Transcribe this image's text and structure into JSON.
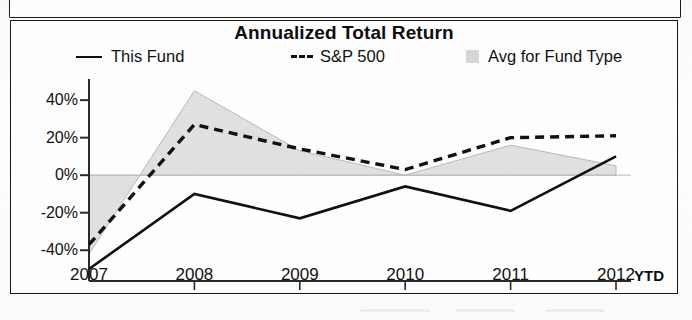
{
  "document": {
    "partial_box_above": true
  },
  "chart_panel": {
    "title": "Annualized Total Return",
    "legend": [
      {
        "key": "this_fund",
        "label": "This Fund",
        "marker": "solid-line-swatch",
        "color": "#111111"
      },
      {
        "key": "sp500",
        "label": "S&P 500",
        "marker": "dashed-line-swatch",
        "color": "#111111"
      },
      {
        "key": "avg_fund_type",
        "label": "Avg for Fund Type",
        "marker": "gray-area-swatch",
        "color": "#cfcfcf"
      }
    ],
    "x_axis_suffix": "YTD"
  },
  "chart_data": {
    "type": "line",
    "title": "Annualized Total Return",
    "xlabel": "",
    "ylabel": "",
    "categories": [
      "2007",
      "2008",
      "2009",
      "2010",
      "2011",
      "2012"
    ],
    "x_tick_labels": [
      "2007",
      "2008",
      "2009",
      "2010",
      "2011",
      "2012"
    ],
    "x_axis_note": "YTD",
    "y_tick_labels": [
      "40%",
      "20%",
      "0%",
      "-20%",
      "-40%"
    ],
    "y_ticks": [
      40,
      20,
      0,
      -20,
      -40
    ],
    "ylim": [
      -50,
      47
    ],
    "grid": false,
    "legend_position": "top",
    "zero_baseline": 0,
    "series": [
      {
        "name": "This Fund",
        "style": "solid",
        "color": "#111111",
        "values": [
          -50,
          -10,
          -23,
          -6,
          -19,
          10
        ]
      },
      {
        "name": "S&P 500",
        "style": "dashed",
        "color": "#111111",
        "values": [
          -37,
          27,
          14,
          3,
          20,
          21
        ]
      },
      {
        "name": "Avg for Fund Type",
        "style": "filled-area-to-zero",
        "color": "#cfcfcf",
        "values": [
          -42,
          45,
          13,
          0,
          16,
          5
        ]
      }
    ]
  }
}
